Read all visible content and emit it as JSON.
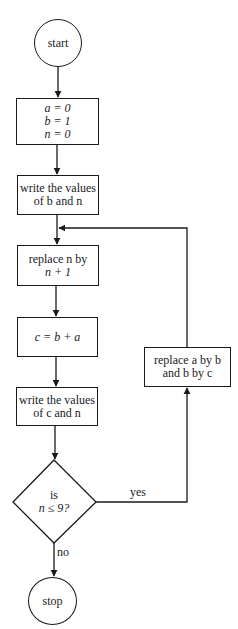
{
  "flowchart": {
    "nodes": [
      {
        "id": "start",
        "shape": "circle",
        "lines": [
          "start"
        ]
      },
      {
        "id": "init",
        "shape": "rectangle",
        "lines": [
          "a = 0",
          "b = 1",
          "n = 0"
        ]
      },
      {
        "id": "write_b_n",
        "shape": "rectangle",
        "lines": [
          "write the values",
          "of b and n"
        ]
      },
      {
        "id": "increment_n",
        "shape": "rectangle",
        "lines": [
          "replace n by",
          "n + 1"
        ]
      },
      {
        "id": "compute_c",
        "shape": "rectangle",
        "lines": [
          "c = b + a"
        ]
      },
      {
        "id": "write_c_n",
        "shape": "rectangle",
        "lines": [
          "write the values",
          "of c and n"
        ]
      },
      {
        "id": "decision",
        "shape": "diamond",
        "lines": [
          "is",
          "n ≤ 9?"
        ]
      },
      {
        "id": "shift",
        "shape": "rectangle",
        "lines": [
          "replace a by b",
          "and b by c"
        ]
      },
      {
        "id": "stop",
        "shape": "circle",
        "lines": [
          "stop"
        ]
      }
    ],
    "edges": [
      {
        "from": "start",
        "to": "init",
        "label": ""
      },
      {
        "from": "init",
        "to": "write_b_n",
        "label": ""
      },
      {
        "from": "write_b_n",
        "to": "increment_n",
        "label": ""
      },
      {
        "from": "increment_n",
        "to": "compute_c",
        "label": ""
      },
      {
        "from": "compute_c",
        "to": "write_c_n",
        "label": ""
      },
      {
        "from": "write_c_n",
        "to": "decision",
        "label": ""
      },
      {
        "from": "decision",
        "to": "shift",
        "label": "yes"
      },
      {
        "from": "shift",
        "to": "increment_n",
        "label": ""
      },
      {
        "from": "decision",
        "to": "stop",
        "label": "no"
      }
    ],
    "labels": {
      "start": "start",
      "stop": "stop",
      "yes": "yes",
      "no": "no"
    },
    "colors": {
      "stroke": "#1a1a1a",
      "background": "#ffffff"
    }
  }
}
